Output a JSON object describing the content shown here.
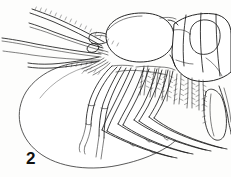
{
  "figure": {
    "label": "2",
    "caption_number": "2",
    "background_color": "#fdfdfc",
    "ink_color": "#1b1b1b",
    "width_px": 231,
    "height_px": 177,
    "parts": {
      "antenna_1_label": "antennule",
      "antenna_2_label": "antenna",
      "antennal_scale_label": "antennal scale",
      "carapace_label": "carapace",
      "eye_label": "eye",
      "thorax_label": "thoracic somites",
      "abdomen_label": "abdomen",
      "pereopods_label": "pereopods",
      "pleopods_label": "pleopods",
      "uropod_label": "uropod",
      "brood_pouch_label": "brood pouch outline"
    }
  }
}
